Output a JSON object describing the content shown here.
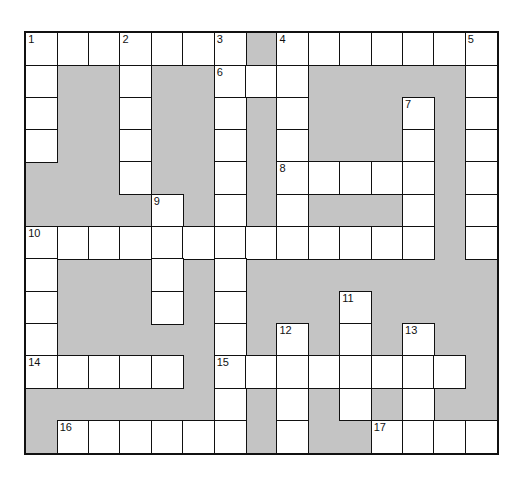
{
  "puzzle": {
    "cols": 15,
    "rows": 13,
    "colors": {
      "block": "#c4c4c4",
      "cell": "#ffffff",
      "line": "#111111"
    },
    "grid": [
      "WWWWWWW#WWWWWWW",
      "W##W##WWW#####W",
      "W##W##W#W###W#W",
      "W##W##W#W###W#W",
      "###W##W#WWWWW#W",
      "####W#W#W###W#W",
      "WWWWWWWWWWWWW#W",
      "W###W#W########",
      "W###W#W###W####",
      "W#####W#W#W#W##",
      "WWWWW#WWWWWWWW#",
      "######W#W#W#W##",
      "#WWWWWW#W##WWWW"
    ],
    "numbers": [
      {
        "n": "1",
        "r": 0,
        "c": 0
      },
      {
        "n": "2",
        "r": 0,
        "c": 3
      },
      {
        "n": "3",
        "r": 0,
        "c": 6
      },
      {
        "n": "4",
        "r": 0,
        "c": 8
      },
      {
        "n": "5",
        "r": 0,
        "c": 14
      },
      {
        "n": "6",
        "r": 1,
        "c": 6
      },
      {
        "n": "7",
        "r": 2,
        "c": 12
      },
      {
        "n": "8",
        "r": 4,
        "c": 8
      },
      {
        "n": "9",
        "r": 5,
        "c": 4
      },
      {
        "n": "10",
        "r": 6,
        "c": 0
      },
      {
        "n": "11",
        "r": 8,
        "c": 10
      },
      {
        "n": "12",
        "r": 9,
        "c": 8
      },
      {
        "n": "13",
        "r": 9,
        "c": 12
      },
      {
        "n": "14",
        "r": 10,
        "c": 0
      },
      {
        "n": "15",
        "r": 10,
        "c": 6
      },
      {
        "n": "16",
        "r": 12,
        "c": 1
      },
      {
        "n": "17",
        "r": 12,
        "c": 11
      }
    ]
  }
}
